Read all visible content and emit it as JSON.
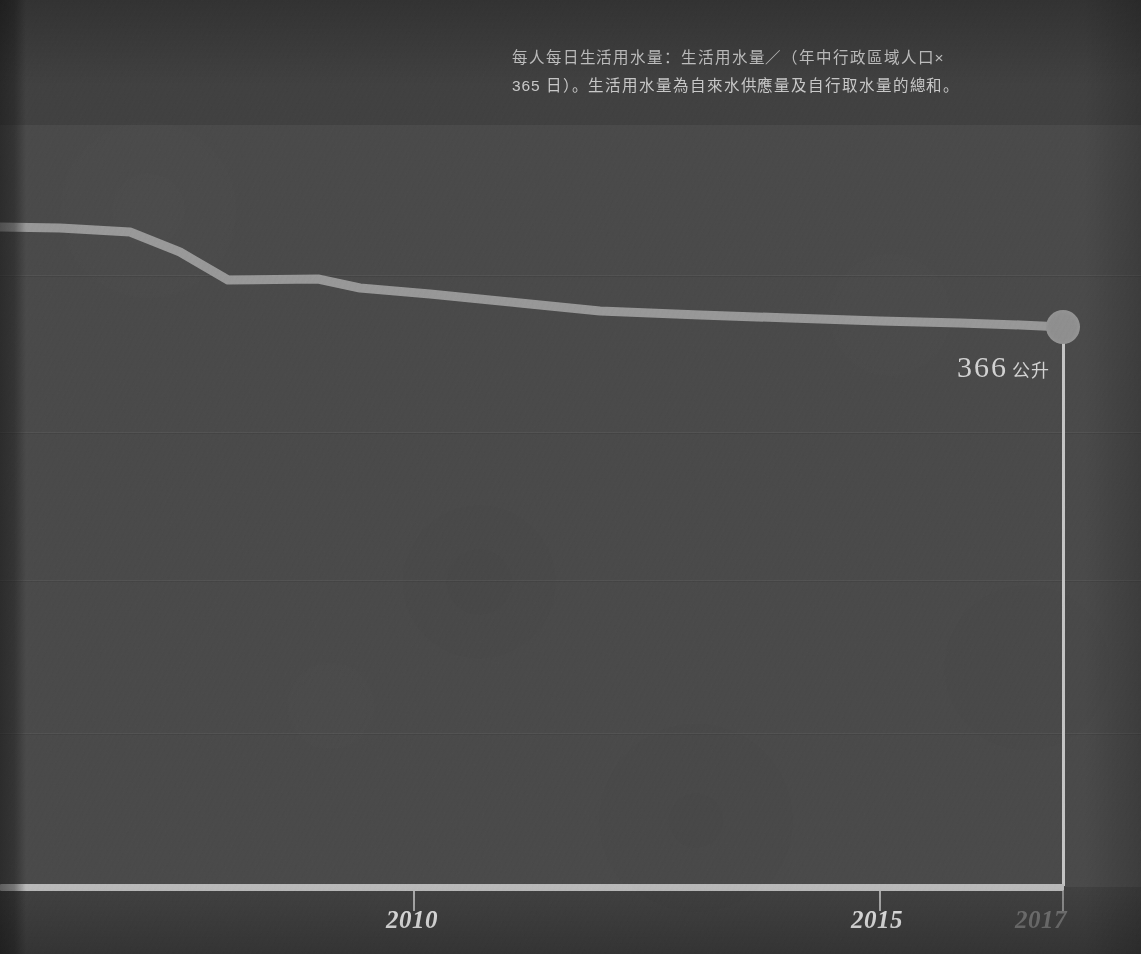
{
  "caption": {
    "line1": "每人每日生活用水量：生活用水量／（年中行政區域人口×",
    "line2": "365 日）。生活用水量為自來水供應量及自行取水量的總和。"
  },
  "value_callout": {
    "number": "366",
    "unit": "公升"
  },
  "axis": {
    "ticks": [
      {
        "label": "2010",
        "x": 414,
        "dim": false
      },
      {
        "label": "2015",
        "x": 880,
        "dim": false
      },
      {
        "label": "2017",
        "x": 1066,
        "dim": true
      }
    ]
  },
  "colors": {
    "background": "#414141",
    "panel": "#4a4a4a",
    "line": "#9e9e9e",
    "axis": "#b9b9b9",
    "text": "#c9c9c9",
    "text_dim": "#747474",
    "marker": "#8f8f8f"
  },
  "chart_data": {
    "type": "line",
    "title": "每人每日生活用水量",
    "xlabel": "",
    "ylabel": "公升",
    "unit": "公升",
    "grid": true,
    "legend": "none",
    "xlim": [
      2006,
      2017
    ],
    "ylim": [
      0,
      450
    ],
    "x": [
      2006,
      2007,
      2008,
      2009,
      2010,
      2011,
      2012,
      2013,
      2014,
      2015,
      2016,
      2017
    ],
    "values": [
      408,
      407,
      405,
      390,
      388,
      381,
      376,
      373,
      371,
      370,
      368,
      366
    ],
    "xtick_labels": [
      "2010",
      "2015",
      "2017"
    ],
    "annotations": [
      {
        "text": "366 公升",
        "x": 2017,
        "y": 366
      }
    ],
    "series": [
      {
        "name": "每人每日生活用水量",
        "values": [
          408,
          407,
          405,
          390,
          388,
          381,
          376,
          373,
          371,
          370,
          368,
          366
        ]
      }
    ],
    "gridline_pixel_y": [
      275,
      432,
      580,
      733
    ],
    "polyline_pixel_points": "0,227 60,228 130,232 180,252 228,280 318,279 360,288 430,294 520,303 600,311 700,315 790,318 880,321 960,323 1020,325 1063,327"
  }
}
